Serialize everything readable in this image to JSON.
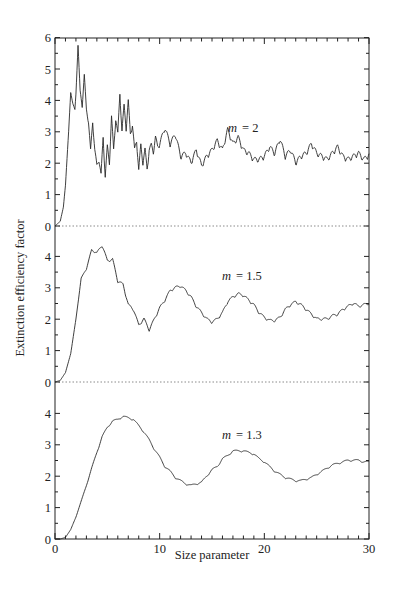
{
  "chart_data": {
    "type": "line",
    "title": "",
    "xlabel": "Size parameter",
    "ylabel": "Extinction efficiency factor",
    "xlim": [
      0,
      30
    ],
    "x_ticks": [
      0,
      10,
      20,
      30
    ],
    "x_tick_labels": [
      "0",
      "10",
      "20",
      "30"
    ],
    "grid": false,
    "legend": "none (inline annotations per panel)",
    "panels": [
      {
        "annotation": "m = 2",
        "annotation_m": "m",
        "annotation_value": "= 2",
        "ylim": [
          0,
          6
        ],
        "y_tick_labels": [
          "0",
          "1",
          "2",
          "3",
          "4",
          "5",
          "6"
        ],
        "x": [
          0,
          0.5,
          0.8,
          1.0,
          1.3,
          1.5,
          1.7,
          1.9,
          2.0,
          2.2,
          2.4,
          2.6,
          2.8,
          3.0,
          3.2,
          3.4,
          3.6,
          3.8,
          4.0,
          4.2,
          4.4,
          4.6,
          4.8,
          5.0,
          5.2,
          5.4,
          5.6,
          5.8,
          6.0,
          6.2,
          6.4,
          6.6,
          6.8,
          7.0,
          7.2,
          7.4,
          7.6,
          7.8,
          8.0,
          8.2,
          8.4,
          8.6,
          8.8,
          9.0,
          9.2,
          9.4,
          9.6,
          9.8,
          10.0,
          10.5,
          11.0,
          11.5,
          12.0,
          12.5,
          13.0,
          13.5,
          14.0,
          14.5,
          15.0,
          15.5,
          16.0,
          16.5,
          17.0,
          17.5,
          18.0,
          18.5,
          19.0,
          19.5,
          20.0,
          20.5,
          21.0,
          21.5,
          22.0,
          22.5,
          23.0,
          23.5,
          24.0,
          24.5,
          25.0,
          25.5,
          26.0,
          26.5,
          27.0,
          27.5,
          28.0,
          28.5,
          29.0,
          29.5,
          30.0
        ],
        "values": [
          0,
          0.15,
          0.6,
          1.3,
          3.0,
          4.25,
          3.9,
          3.7,
          4.2,
          5.75,
          4.3,
          3.8,
          4.8,
          3.7,
          3.3,
          2.4,
          3.3,
          2.4,
          1.9,
          2.1,
          1.6,
          2.8,
          1.55,
          2.5,
          2.0,
          3.45,
          2.4,
          3.4,
          2.9,
          4.2,
          3.0,
          3.8,
          3.1,
          3.95,
          2.9,
          3.2,
          2.4,
          2.7,
          1.75,
          2.55,
          2.0,
          2.4,
          1.8,
          2.4,
          2.55,
          2.35,
          2.8,
          2.5,
          2.6,
          3.1,
          2.6,
          2.9,
          2.2,
          2.3,
          2.0,
          2.4,
          1.9,
          2.2,
          2.4,
          2.7,
          2.4,
          3.05,
          2.6,
          2.8,
          2.4,
          2.3,
          2.1,
          2.1,
          2.2,
          2.5,
          2.3,
          2.75,
          2.2,
          2.4,
          2.0,
          2.2,
          2.3,
          2.6,
          2.3,
          2.2,
          2.1,
          2.3,
          2.5,
          2.2,
          2.1,
          2.2,
          2.3,
          2.1,
          2.25
        ]
      },
      {
        "annotation": "m = 1.5",
        "annotation_m": "m",
        "annotation_value": "= 1.5",
        "ylim": [
          0,
          4.8
        ],
        "y_tick_labels": [
          "0",
          "1",
          "2",
          "3",
          "4"
        ],
        "x": [
          0,
          0.5,
          1.0,
          1.5,
          2.0,
          2.5,
          3.0,
          3.5,
          4.0,
          4.5,
          5.0,
          5.5,
          6.0,
          6.5,
          7.0,
          7.5,
          8.0,
          8.5,
          9.0,
          9.5,
          10.0,
          10.5,
          11.0,
          11.5,
          12.0,
          12.5,
          13.0,
          13.5,
          14.0,
          14.5,
          15.0,
          15.5,
          16.0,
          16.5,
          17.0,
          17.5,
          18.0,
          18.5,
          19.0,
          19.5,
          20.0,
          20.5,
          21.0,
          21.5,
          22.0,
          22.5,
          23.0,
          23.5,
          24.0,
          24.5,
          25.0,
          25.5,
          26.0,
          26.5,
          27.0,
          27.5,
          28.0,
          28.5,
          29.0,
          29.5,
          30.0
        ],
        "values": [
          0,
          0.05,
          0.3,
          0.9,
          2.0,
          3.3,
          3.6,
          4.2,
          4.1,
          4.35,
          3.85,
          3.9,
          3.2,
          3.1,
          2.45,
          2.3,
          1.8,
          2.0,
          1.65,
          2.0,
          2.35,
          2.6,
          2.9,
          3.0,
          3.05,
          2.9,
          2.7,
          2.4,
          2.2,
          2.0,
          1.9,
          2.0,
          2.2,
          2.55,
          2.7,
          2.8,
          2.75,
          2.6,
          2.45,
          2.2,
          2.05,
          1.95,
          1.95,
          2.05,
          2.3,
          2.45,
          2.55,
          2.45,
          2.3,
          2.15,
          2.0,
          2.0,
          2.0,
          2.1,
          2.15,
          2.3,
          2.4,
          2.5,
          2.4,
          2.45,
          2.5
        ]
      },
      {
        "annotation": "m = 1.3",
        "annotation_m": "m",
        "annotation_value": "= 1.3",
        "ylim": [
          0,
          4.8
        ],
        "y_tick_labels": [
          "0",
          "1",
          "2",
          "3",
          "4"
        ],
        "x": [
          0,
          0.5,
          1.0,
          1.5,
          2.0,
          2.5,
          3.0,
          3.5,
          4.0,
          4.5,
          5.0,
          5.5,
          6.0,
          6.5,
          7.0,
          7.5,
          8.0,
          8.5,
          9.0,
          9.5,
          10.0,
          10.5,
          11.0,
          11.5,
          12.0,
          12.5,
          13.0,
          13.5,
          14.0,
          14.5,
          15.0,
          15.5,
          16.0,
          16.5,
          17.0,
          17.5,
          18.0,
          18.5,
          19.0,
          19.5,
          20.0,
          20.5,
          21.0,
          21.5,
          22.0,
          22.5,
          23.0,
          23.5,
          24.0,
          24.5,
          25.0,
          25.5,
          26.0,
          26.5,
          27.0,
          27.5,
          28.0,
          28.5,
          29.0,
          29.5,
          30.0
        ],
        "values": [
          0,
          0,
          0.05,
          0.3,
          0.7,
          1.2,
          1.7,
          2.25,
          2.75,
          3.25,
          3.55,
          3.75,
          3.8,
          3.9,
          3.85,
          3.8,
          3.6,
          3.4,
          3.15,
          2.85,
          2.6,
          2.3,
          2.15,
          1.95,
          1.85,
          1.75,
          1.7,
          1.75,
          1.8,
          2.0,
          2.2,
          2.3,
          2.55,
          2.65,
          2.8,
          2.8,
          2.8,
          2.75,
          2.7,
          2.55,
          2.45,
          2.3,
          2.15,
          2.05,
          1.95,
          1.9,
          1.85,
          1.85,
          1.9,
          1.95,
          2.05,
          2.15,
          2.25,
          2.35,
          2.4,
          2.45,
          2.5,
          2.5,
          2.5,
          2.45,
          2.45
        ]
      }
    ]
  },
  "layout": {
    "plot_left": 55,
    "plot_right": 369,
    "plot_top": 38,
    "plot_bottom": 539,
    "panel_baselines": [
      226,
      382,
      539
    ],
    "px_per_unit_y": 31.4,
    "line_color": "#2a2a2a",
    "zero_line_color": "#8a8a8a"
  }
}
